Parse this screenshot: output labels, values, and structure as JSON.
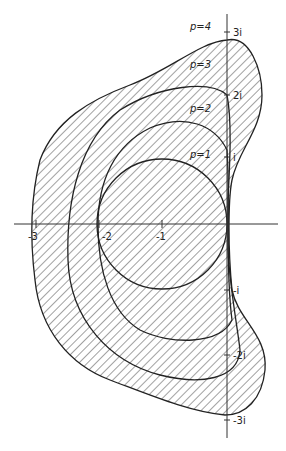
{
  "diagram": {
    "type": "stability-regions-complex-plane",
    "regions": [
      {
        "label": "p=1"
      },
      {
        "label": "p=2"
      },
      {
        "label": "p=3"
      },
      {
        "label": "p=4"
      }
    ],
    "real_axis_ticks": [
      "-3",
      "-2",
      "-1"
    ],
    "imag_axis_ticks": [
      "3i",
      "2i",
      "i",
      "-i",
      "-2i",
      "-3i"
    ],
    "colors": {
      "line": "#222222",
      "hatch": "#444444",
      "background": "#ffffff"
    }
  }
}
